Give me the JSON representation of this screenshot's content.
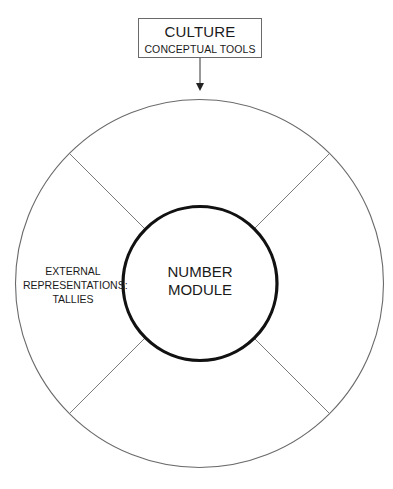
{
  "culture_box": {
    "title": "CULTURE",
    "subtitle": "CONCEPTUAL TOOLS"
  },
  "center_module": {
    "line1": "NUMBER",
    "line2": "MODULE"
  },
  "segments": {
    "left": {
      "line1": "EXTERNAL",
      "line2": "REPRESENTATIONS:",
      "line3": "TALLIES"
    }
  },
  "colors": {
    "inner_circle_stroke": "#111111",
    "outer_circle_stroke": "#6a6a6a",
    "divider_stroke": "#7a7a7a",
    "arrow_stroke": "#333333"
  }
}
